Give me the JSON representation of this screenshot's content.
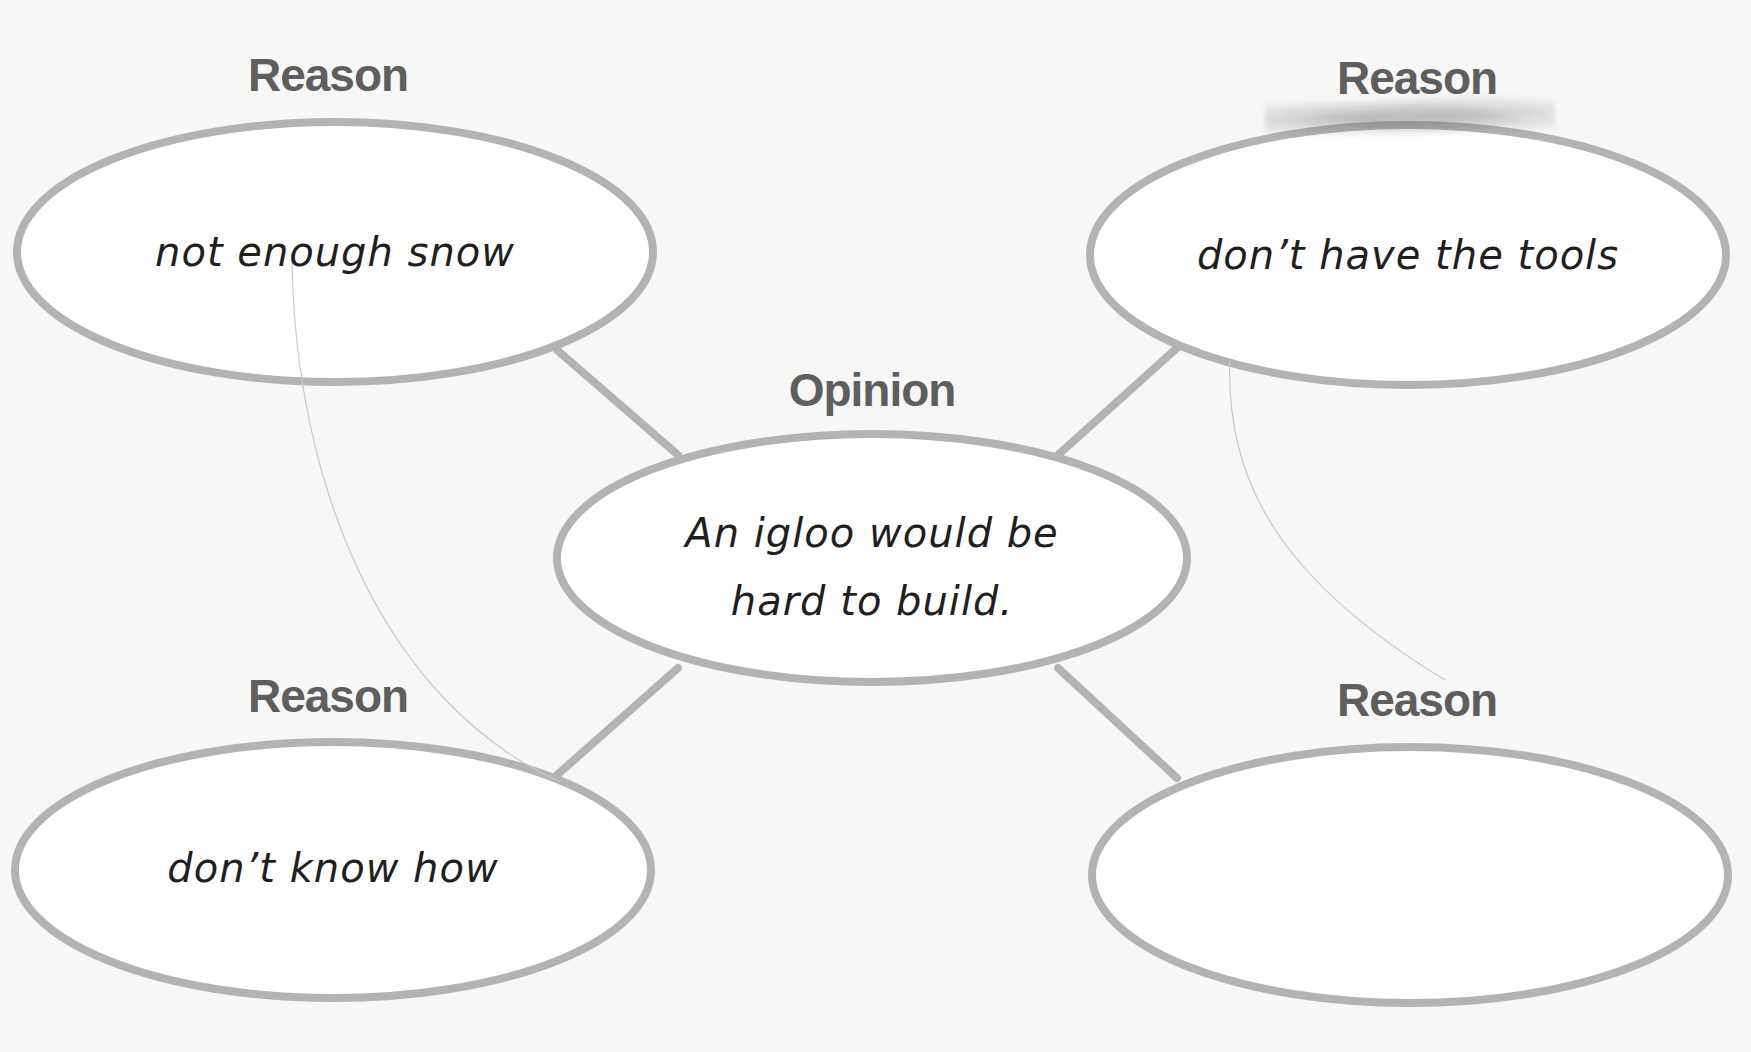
{
  "diagram": {
    "type": "opinion-reason web",
    "colors": {
      "outline": "#b3b3b3",
      "heading": "#5e5e5e",
      "handwriting": "#1f1f1f",
      "background": "#f7f7f6"
    },
    "opinion": {
      "heading": "Opinion",
      "text_line1": "An igloo would be",
      "text_line2": "hard to build."
    },
    "reasons": [
      {
        "position": "top-left",
        "heading": "Reason",
        "text": "not enough snow"
      },
      {
        "position": "top-right",
        "heading": "Reason",
        "text": "don’t have the tools"
      },
      {
        "position": "bottom-left",
        "heading": "Reason",
        "text": "don’t know how"
      },
      {
        "position": "bottom-right",
        "heading": "Reason",
        "text": ""
      }
    ]
  }
}
